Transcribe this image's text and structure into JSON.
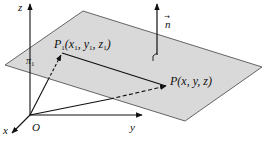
{
  "diagram": {
    "type": "3d-plane-point-normal",
    "colors": {
      "plane_fill": "#d9d9d9",
      "plane_edge": "#555555",
      "ink": "#111111",
      "background": "#ffffff"
    },
    "axes": {
      "origin_label": "O",
      "x_label": "x",
      "y_label": "y",
      "z_label": "z"
    },
    "plane": {
      "label": "π",
      "label_sub": "1"
    },
    "normal": {
      "label": "n",
      "arrow_mark": "→"
    },
    "points": {
      "p1": {
        "name": "P",
        "sub": "1",
        "coords": "(x",
        "c1sub": "1",
        "c2": ", y",
        "c2sub": "1",
        "c3": ", z",
        "c3sub": "1",
        "close": ")"
      },
      "p": {
        "label": "P(x, y, z)"
      }
    }
  }
}
